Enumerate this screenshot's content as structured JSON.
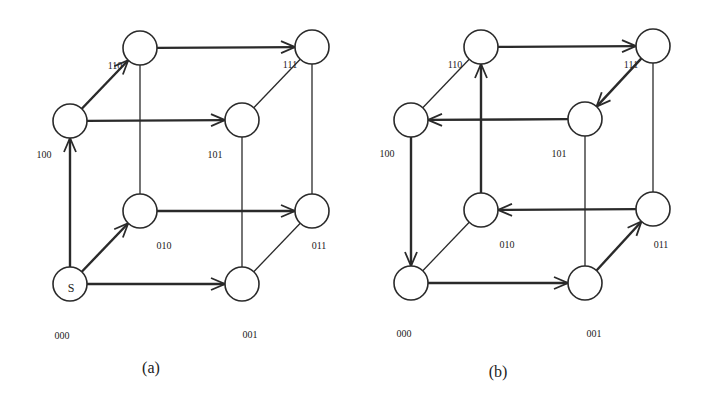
{
  "figure": {
    "panels": [
      {
        "caption": "(a)",
        "start_symbol": "S",
        "nodes": [
          {
            "id": "000",
            "label": "000",
            "x": 70,
            "y": 284,
            "lx": 62,
            "ly": 335
          },
          {
            "id": "001",
            "label": "001",
            "x": 242,
            "y": 284,
            "lx": 250,
            "ly": 334
          },
          {
            "id": "010",
            "label": "010",
            "x": 140,
            "y": 211,
            "lx": 164,
            "ly": 245
          },
          {
            "id": "011",
            "label": "011",
            "x": 312,
            "y": 211,
            "lx": 319,
            "ly": 245
          },
          {
            "id": "100",
            "label": "100",
            "x": 70,
            "y": 121,
            "lx": 44,
            "ly": 154
          },
          {
            "id": "101",
            "label": "101",
            "x": 242,
            "y": 120,
            "lx": 215,
            "ly": 154
          },
          {
            "id": "110",
            "label": "110",
            "x": 140,
            "y": 48,
            "lx": 115,
            "ly": 65
          },
          {
            "id": "111",
            "label": "111",
            "x": 312,
            "y": 47,
            "lx": 290,
            "ly": 64
          }
        ],
        "edges": [
          {
            "from": "000",
            "to": "100",
            "directed": true
          },
          {
            "from": "000",
            "to": "010",
            "directed": true
          },
          {
            "from": "000",
            "to": "001",
            "directed": true
          },
          {
            "from": "100",
            "to": "110",
            "directed": true
          },
          {
            "from": "100",
            "to": "101",
            "directed": true
          },
          {
            "from": "110",
            "to": "111",
            "directed": true
          },
          {
            "from": "010",
            "to": "011",
            "directed": true
          },
          {
            "from": "010",
            "to": "110",
            "directed": false
          },
          {
            "from": "001",
            "to": "101",
            "directed": false
          },
          {
            "from": "001",
            "to": "011",
            "directed": false
          },
          {
            "from": "011",
            "to": "111",
            "directed": false
          },
          {
            "from": "101",
            "to": "111",
            "directed": false
          }
        ]
      },
      {
        "caption": "(b)",
        "nodes": [
          {
            "id": "000",
            "label": "000",
            "x": 411,
            "y": 283,
            "lx": 404,
            "ly": 333
          },
          {
            "id": "001",
            "label": "001",
            "x": 585,
            "y": 283,
            "lx": 594,
            "ly": 333
          },
          {
            "id": "010",
            "label": "010",
            "x": 481,
            "y": 210,
            "lx": 507,
            "ly": 244
          },
          {
            "id": "011",
            "label": "011",
            "x": 653,
            "y": 209,
            "lx": 661,
            "ly": 244
          },
          {
            "id": "100",
            "label": "100",
            "x": 411,
            "y": 120,
            "lx": 387,
            "ly": 153
          },
          {
            "id": "101",
            "label": "101",
            "x": 585,
            "y": 119,
            "lx": 559,
            "ly": 153
          },
          {
            "id": "110",
            "label": "110",
            "x": 481,
            "y": 47,
            "lx": 455,
            "ly": 64
          },
          {
            "id": "111",
            "label": "111",
            "x": 653,
            "y": 46,
            "lx": 631,
            "ly": 64
          }
        ],
        "edges": [
          {
            "from": "100",
            "to": "000",
            "directed": true
          },
          {
            "from": "000",
            "to": "001",
            "directed": true
          },
          {
            "from": "000",
            "to": "010",
            "directed": false
          },
          {
            "from": "001",
            "to": "011",
            "directed": true
          },
          {
            "from": "011",
            "to": "010",
            "directed": true
          },
          {
            "from": "010",
            "to": "110",
            "directed": true
          },
          {
            "from": "110",
            "to": "111",
            "directed": true
          },
          {
            "from": "111",
            "to": "101",
            "directed": true
          },
          {
            "from": "101",
            "to": "100",
            "directed": true
          },
          {
            "from": "100",
            "to": "110",
            "directed": false
          },
          {
            "from": "001",
            "to": "101",
            "directed": false
          },
          {
            "from": "011",
            "to": "111",
            "directed": false
          }
        ],
        "caption_pos": {
          "x": 498,
          "y": 372
        }
      }
    ],
    "caption_a_pos": {
      "x": 151,
      "y": 368
    },
    "node_radius": 17,
    "stroke_color": "#2a2a2a",
    "directed_stroke_width": 2.4,
    "undirected_stroke_width": 1.3
  }
}
